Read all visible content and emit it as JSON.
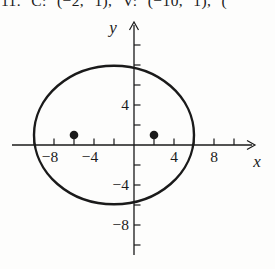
{
  "page": {
    "background": "#fdfdfc",
    "ink": "#1a1a1a"
  },
  "header": {
    "clipped_exercise_text": "11. C: (−2, 1), V: (−10, 1), ("
  },
  "chart_data": {
    "type": "scatter",
    "title": "",
    "xlabel": "x",
    "ylabel": "y",
    "xlim": [
      -12.2,
      12.2
    ],
    "ylim": [
      -11,
      12.4
    ],
    "grid": false,
    "x_ticks": [
      -10,
      -8,
      -6,
      -4,
      -2,
      2,
      4,
      6,
      8,
      10
    ],
    "y_ticks": [
      -10,
      -8,
      -6,
      -4,
      -2,
      2,
      4,
      6,
      8,
      10
    ],
    "x_tick_labels": [
      {
        "value": -8,
        "label": "−8"
      },
      {
        "value": -4,
        "label": "−4"
      },
      {
        "value": 4,
        "label": "4"
      },
      {
        "value": 8,
        "label": "8"
      }
    ],
    "y_tick_labels": [
      {
        "value": 4,
        "label": "4"
      },
      {
        "value": -4,
        "label": "−4"
      },
      {
        "value": -8,
        "label": "−8"
      }
    ],
    "ellipse": {
      "center_x": -2,
      "center_y": 1,
      "semi_axis_x": 8,
      "semi_axis_y": 6.93
    },
    "points": [
      {
        "x": -6,
        "y": 1,
        "label": "focus"
      },
      {
        "x": 2,
        "y": 1,
        "label": "focus"
      }
    ]
  }
}
